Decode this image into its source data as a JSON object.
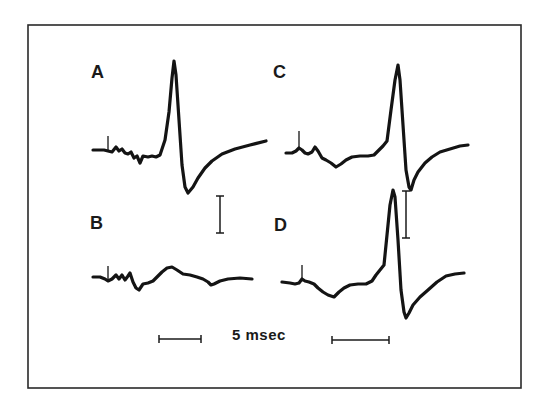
{
  "figure": {
    "panels": [
      {
        "id": "A",
        "label": "A"
      },
      {
        "id": "B",
        "label": "B"
      },
      {
        "id": "C",
        "label": "C"
      },
      {
        "id": "D",
        "label": "D"
      }
    ],
    "time_scale_label": "5 msec"
  },
  "colors": {
    "trace": "#141414",
    "frame": "#2a2a2a",
    "background": "#ffffff"
  },
  "chart_data": {
    "type": "line",
    "title": "",
    "xlabel": "",
    "ylabel": "",
    "grid": false,
    "legend": "none",
    "annotations": [
      "A",
      "B",
      "C",
      "D",
      "5 msec",
      "vertical amplitude scale bars (unlabeled)"
    ],
    "layout": "2x2 panels: A (top-left), B (bottom-left), C (top-right), D (bottom-right)",
    "time_scale": {
      "label": "5 msec",
      "bars": 2
    },
    "series": [
      {
        "name": "A",
        "description": "Evoked response with stimulus artifact, small early wavelets, large biphasic spike (sharp positive peak then deep negative trough) with slow recovery",
        "points_px": [
          [
            93,
            150
          ],
          [
            104,
            150
          ],
          [
            108,
            151
          ],
          [
            112,
            152
          ],
          [
            116,
            147
          ],
          [
            119,
            151
          ],
          [
            122,
            149
          ],
          [
            125,
            153
          ],
          [
            128,
            154
          ],
          [
            131,
            152
          ],
          [
            134,
            158
          ],
          [
            137,
            156
          ],
          [
            140,
            163
          ],
          [
            143,
            156
          ],
          [
            148,
            157
          ],
          [
            152,
            156
          ],
          [
            156,
            157
          ],
          [
            160,
            155
          ],
          [
            165,
            140
          ],
          [
            169,
            112
          ],
          [
            172,
            78
          ],
          [
            174,
            61
          ],
          [
            176,
            75
          ],
          [
            179,
            120
          ],
          [
            182,
            165
          ],
          [
            185,
            187
          ],
          [
            188,
            193
          ],
          [
            193,
            187
          ],
          [
            198,
            178
          ],
          [
            205,
            168
          ],
          [
            212,
            161
          ],
          [
            222,
            154
          ],
          [
            235,
            149
          ],
          [
            250,
            145
          ],
          [
            266,
            141
          ]
        ]
      },
      {
        "name": "B",
        "description": "Small response: stimulus artifact, early wavelets, low broad hump, no large spike",
        "points_px": [
          [
            93,
            277
          ],
          [
            100,
            277
          ],
          [
            105,
            279
          ],
          [
            108,
            281
          ],
          [
            112,
            279
          ],
          [
            116,
            275
          ],
          [
            119,
            279
          ],
          [
            122,
            275
          ],
          [
            125,
            280
          ],
          [
            128,
            276
          ],
          [
            130,
            273
          ],
          [
            133,
            282
          ],
          [
            136,
            288
          ],
          [
            139,
            290
          ],
          [
            143,
            284
          ],
          [
            148,
            283
          ],
          [
            153,
            281
          ],
          [
            158,
            276
          ],
          [
            162,
            272
          ],
          [
            167,
            268
          ],
          [
            172,
            267
          ],
          [
            177,
            270
          ],
          [
            183,
            274
          ],
          [
            190,
            275
          ],
          [
            197,
            277
          ],
          [
            203,
            279
          ],
          [
            208,
            282
          ],
          [
            211,
            285
          ],
          [
            214,
            284
          ],
          [
            220,
            281
          ],
          [
            228,
            279
          ],
          [
            240,
            278
          ],
          [
            252,
            279
          ]
        ]
      },
      {
        "name": "C",
        "description": "Stimulus artifact with early wavelets and negative dip, large biphasic spike, recovery",
        "points_px": [
          [
            286,
            153
          ],
          [
            292,
            153
          ],
          [
            296,
            151
          ],
          [
            299,
            148
          ],
          [
            302,
            150
          ],
          [
            305,
            153
          ],
          [
            308,
            154
          ],
          [
            312,
            152
          ],
          [
            315,
            147
          ],
          [
            318,
            151
          ],
          [
            322,
            158
          ],
          [
            326,
            160
          ],
          [
            331,
            163
          ],
          [
            336,
            167
          ],
          [
            341,
            164
          ],
          [
            346,
            160
          ],
          [
            352,
            157
          ],
          [
            360,
            156
          ],
          [
            368,
            156
          ],
          [
            374,
            155
          ],
          [
            378,
            151
          ],
          [
            383,
            146
          ],
          [
            387,
            141
          ],
          [
            391,
            110
          ],
          [
            395,
            80
          ],
          [
            398,
            65
          ],
          [
            400,
            80
          ],
          [
            403,
            125
          ],
          [
            406,
            170
          ],
          [
            409,
            187
          ],
          [
            411,
            190
          ],
          [
            414,
            180
          ],
          [
            418,
            172
          ],
          [
            425,
            163
          ],
          [
            432,
            157
          ],
          [
            440,
            152
          ],
          [
            450,
            149
          ],
          [
            460,
            146
          ],
          [
            468,
            145
          ]
        ]
      },
      {
        "name": "D",
        "description": "Stimulus artifact, early negative dip, very large biphasic spike (tallest peak) with deep trough and recovery",
        "points_px": [
          [
            282,
            282
          ],
          [
            290,
            283
          ],
          [
            295,
            284
          ],
          [
            299,
            283
          ],
          [
            302,
            279
          ],
          [
            305,
            281
          ],
          [
            309,
            282
          ],
          [
            314,
            284
          ],
          [
            318,
            288
          ],
          [
            323,
            292
          ],
          [
            328,
            295
          ],
          [
            334,
            297
          ],
          [
            339,
            292
          ],
          [
            344,
            288
          ],
          [
            350,
            285
          ],
          [
            358,
            284
          ],
          [
            366,
            284
          ],
          [
            372,
            281
          ],
          [
            376,
            275
          ],
          [
            380,
            270
          ],
          [
            384,
            265
          ],
          [
            387,
            235
          ],
          [
            390,
            205
          ],
          [
            393,
            190
          ],
          [
            395,
            197
          ],
          [
            398,
            240
          ],
          [
            401,
            290
          ],
          [
            404,
            312
          ],
          [
            406,
            318
          ],
          [
            409,
            313
          ],
          [
            413,
            305
          ],
          [
            420,
            297
          ],
          [
            428,
            290
          ],
          [
            437,
            282
          ],
          [
            446,
            276
          ],
          [
            455,
            274
          ],
          [
            464,
            273
          ]
        ]
      }
    ]
  }
}
